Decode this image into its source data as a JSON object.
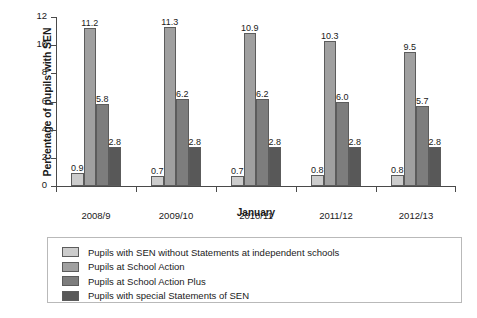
{
  "chart_data": {
    "type": "bar",
    "title": "",
    "xlabel": "January",
    "ylabel": "Percentage of pupils with SEN",
    "ylim": [
      0,
      12
    ],
    "yticks": [
      0,
      2,
      4,
      6,
      8,
      10,
      12
    ],
    "grid": false,
    "legend_position": "bottom",
    "categories": [
      "2008/9",
      "2009/10",
      "2010/11",
      "2011/12",
      "2012/13"
    ],
    "series": [
      {
        "name": "Pupils with SEN without Statements at independent schools",
        "color": "#cccccc",
        "values": [
          0.9,
          0.7,
          0.7,
          0.8,
          0.8
        ],
        "labels": [
          "0.9",
          "0.7",
          "0.7",
          "0.8",
          "0.8"
        ]
      },
      {
        "name": "Pupils at School Action",
        "color": "#a0a0a0",
        "values": [
          11.2,
          11.3,
          10.9,
          10.3,
          9.5
        ],
        "labels": [
          "11.2",
          "11.3",
          "10.9",
          "10.3",
          "9.5"
        ]
      },
      {
        "name": "Pupils at School Action Plus",
        "color": "#7d7d7d",
        "values": [
          5.8,
          6.2,
          6.2,
          6.0,
          5.7
        ],
        "labels": [
          "5.8",
          "6.2",
          "6.2",
          "6.0",
          "5.7"
        ]
      },
      {
        "name": "Pupils with special Statements of SEN",
        "color": "#585858",
        "values": [
          2.8,
          2.8,
          2.8,
          2.8,
          2.8
        ],
        "labels": [
          "2.8",
          "2.8",
          "2.8",
          "2.8",
          "2.8"
        ]
      }
    ]
  }
}
